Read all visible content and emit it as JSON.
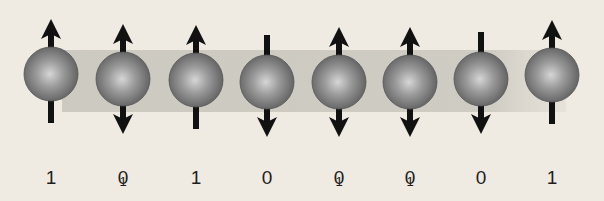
{
  "diagram": {
    "title": "",
    "band": {
      "color": "#c9c6be",
      "x_start": 62,
      "x_end": 566,
      "y_top": 50,
      "y_bottom": 112
    },
    "sphere_color": "#8c8c8c",
    "arrow_color": "#111111",
    "qubits": [
      {
        "x": 51,
        "y": 74,
        "spin": "up",
        "label": "1"
      },
      {
        "x": 123,
        "y": 79,
        "spin": "superposed",
        "label": "0",
        "overlay": "1"
      },
      {
        "x": 196,
        "y": 80,
        "spin": "up",
        "label": "1"
      },
      {
        "x": 267,
        "y": 82,
        "spin": "down",
        "label": "0"
      },
      {
        "x": 339,
        "y": 82,
        "spin": "superposed",
        "label": "0",
        "overlay": "1"
      },
      {
        "x": 410,
        "y": 82,
        "spin": "superposed",
        "label": "0",
        "overlay": "1"
      },
      {
        "x": 481,
        "y": 79,
        "spin": "down",
        "label": "0"
      },
      {
        "x": 552,
        "y": 75,
        "spin": "up",
        "label": "1"
      }
    ],
    "bits": [
      "1",
      "0",
      "1",
      "0",
      "0",
      "0",
      "0",
      "1"
    ]
  }
}
